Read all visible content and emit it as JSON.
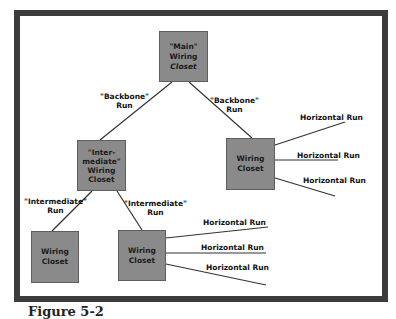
{
  "diagram": {
    "nodes": {
      "main": {
        "line1": "\"Main\"",
        "line2": "Wiring",
        "line3": "Closet"
      },
      "intermediate": {
        "line1": "\"Inter-",
        "line2": "mediate\"",
        "line3": "Wiring",
        "line4": "Closet"
      },
      "right": {
        "line1": "Wiring",
        "line2": "Closet"
      },
      "bottom_left": {
        "line1": "Wiring",
        "line2": "Closet"
      },
      "bottom_mid": {
        "line1": "Wiring",
        "line2": "Closet"
      }
    },
    "edges": {
      "backbone_left": {
        "line1": "\"Backbone\"",
        "line2": "Run"
      },
      "backbone_right": {
        "line1": "\"Backbone\"",
        "line2": "Run"
      },
      "intermediate_left": {
        "line1": "\"Intermediate\"",
        "line2": "Run"
      },
      "intermediate_right": {
        "line1": "\"Intermediate\"",
        "line2": "Run"
      }
    },
    "horizontal_runs": {
      "right_1": "Horizontal Run",
      "right_2": "Horizontal Run",
      "right_3": "Horizontal Run",
      "mid_1": "Horizontal Run",
      "mid_2": "Horizontal Run",
      "mid_3": "Horizontal Run"
    },
    "colors": {
      "box": "#8a8a8a",
      "frame": "#3c3c3c",
      "line": "#333333"
    }
  },
  "caption": "Figure 5-2"
}
